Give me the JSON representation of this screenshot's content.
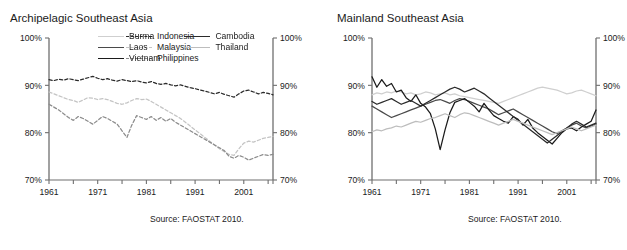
{
  "figure": {
    "cut_top_text": "",
    "source_note": "Source: FAOSTAT 2010."
  },
  "panels": [
    {
      "id": "archipelagic",
      "title": "Archipelagic Southeast Asia",
      "source": "Source: FAOSTAT 2010.",
      "legend_columns": [
        [
          {
            "name": "Indonesia",
            "color": "#2b2b2b",
            "style": "dashed"
          },
          {
            "name": "Malaysia",
            "color": "#c4c4c4",
            "style": "dashed"
          },
          {
            "name": "Philippines",
            "color": "#8c8c8c",
            "style": "dashed"
          }
        ]
      ]
    },
    {
      "id": "mainland",
      "title": "Mainland Southeast Asia",
      "source": "Source: FAOSTAT 2010.",
      "legend_columns": [
        [
          {
            "name": "Burma",
            "color": "#cfcfcf",
            "style": "solid"
          },
          {
            "name": "Laos",
            "color": "#4a4a4a",
            "style": "solid"
          },
          {
            "name": "Vietnam",
            "color": "#1b1b1b",
            "style": "solid"
          }
        ],
        [
          {
            "name": "Cambodia",
            "color": "#2b2b2b",
            "style": "solid"
          },
          {
            "name": "Thailand",
            "color": "#bdbdbd",
            "style": "solid"
          }
        ]
      ]
    }
  ],
  "chart_data": [
    {
      "type": "line",
      "title": "Archipelagic Southeast Asia",
      "xlabel": "",
      "ylabel": "",
      "xlim": [
        1961,
        2007
      ],
      "ylim": [
        70,
        100
      ],
      "yticks": [
        70,
        80,
        90,
        100
      ],
      "ytick_labels": [
        "70%",
        "80%",
        "90%",
        "100%"
      ],
      "xticks": [
        1961,
        1971,
        1981,
        1991,
        2001
      ],
      "xtick_labels": [
        "1961",
        "1971",
        "1981",
        "1991",
        "2001"
      ],
      "x": [
        1961,
        1962,
        1963,
        1964,
        1965,
        1966,
        1967,
        1968,
        1969,
        1970,
        1971,
        1972,
        1973,
        1974,
        1975,
        1976,
        1977,
        1978,
        1979,
        1980,
        1981,
        1982,
        1983,
        1984,
        1985,
        1986,
        1987,
        1988,
        1989,
        1990,
        1991,
        1992,
        1993,
        1994,
        1995,
        1996,
        1997,
        1998,
        1999,
        2000,
        2001,
        2002,
        2003,
        2004,
        2005,
        2006,
        2007
      ],
      "grid": false,
      "legend_position": "upper-center",
      "dual_y_axis": true,
      "series": [
        {
          "name": "Indonesia",
          "color": "#2b2b2b",
          "style": "dashed",
          "values": [
            91.2,
            91.0,
            91.3,
            91.1,
            91.4,
            91.2,
            91.0,
            91.3,
            91.6,
            91.9,
            91.5,
            91.2,
            91.4,
            91.1,
            90.9,
            91.2,
            91.0,
            90.8,
            91.0,
            90.7,
            90.5,
            90.8,
            90.4,
            90.2,
            90.4,
            90.1,
            89.9,
            90.1,
            89.8,
            89.5,
            89.3,
            89.0,
            88.8,
            88.5,
            88.2,
            88.5,
            88.1,
            87.8,
            87.5,
            88.2,
            88.8,
            89.0,
            88.6,
            88.2,
            88.5,
            88.3,
            88.0
          ]
        },
        {
          "name": "Malaysia",
          "color": "#c4c4c4",
          "style": "dashed",
          "values": [
            88.6,
            88.2,
            87.8,
            87.4,
            87.0,
            86.8,
            86.4,
            86.9,
            87.4,
            87.3,
            87.0,
            87.2,
            87.0,
            86.6,
            86.2,
            86.0,
            86.3,
            86.8,
            87.2,
            87.0,
            87.1,
            86.6,
            86.0,
            85.4,
            84.8,
            84.2,
            83.6,
            83.0,
            82.2,
            81.4,
            80.6,
            79.8,
            79.0,
            78.2,
            77.4,
            76.6,
            76.0,
            75.4,
            75.2,
            76.6,
            77.8,
            78.2,
            78.0,
            78.4,
            78.8,
            79.0,
            79.2
          ]
        },
        {
          "name": "Philippines",
          "color": "#8c8c8c",
          "style": "dashed",
          "values": [
            86.0,
            85.4,
            84.8,
            84.0,
            83.2,
            82.6,
            83.4,
            83.0,
            82.4,
            81.8,
            82.6,
            83.4,
            83.0,
            82.4,
            81.8,
            80.4,
            79.0,
            81.6,
            83.6,
            83.2,
            82.8,
            83.4,
            82.6,
            83.2,
            82.4,
            83.0,
            82.2,
            81.6,
            81.0,
            80.4,
            79.8,
            79.2,
            78.6,
            78.0,
            77.4,
            76.8,
            76.2,
            75.0,
            74.6,
            75.2,
            74.8,
            74.2,
            74.6,
            75.0,
            75.4,
            75.2,
            75.4
          ]
        }
      ]
    },
    {
      "type": "line",
      "title": "Mainland Southeast Asia",
      "xlabel": "",
      "ylabel": "",
      "xlim": [
        1961,
        2007
      ],
      "ylim": [
        70,
        100
      ],
      "yticks": [
        70,
        80,
        90,
        100
      ],
      "ytick_labels": [
        "70%",
        "80%",
        "90%",
        "100%"
      ],
      "xticks": [
        1961,
        1971,
        1981,
        1991,
        2001
      ],
      "xtick_labels": [
        "1961",
        "1971",
        "1981",
        "1991",
        "2001"
      ],
      "x": [
        1961,
        1962,
        1963,
        1964,
        1965,
        1966,
        1967,
        1968,
        1969,
        1970,
        1971,
        1972,
        1973,
        1974,
        1975,
        1976,
        1977,
        1978,
        1979,
        1980,
        1981,
        1982,
        1983,
        1984,
        1985,
        1986,
        1987,
        1988,
        1989,
        1990,
        1991,
        1992,
        1993,
        1994,
        1995,
        1996,
        1997,
        1998,
        1999,
        2000,
        2001,
        2002,
        2003,
        2004,
        2005,
        2006,
        2007
      ],
      "grid": false,
      "legend_position": "upper-center",
      "dual_y_axis": true,
      "series": [
        {
          "name": "Burma",
          "color": "#cfcfcf",
          "style": "solid",
          "values": [
            88.0,
            88.4,
            88.2,
            88.6,
            88.4,
            88.8,
            88.6,
            88.2,
            88.4,
            88.0,
            88.2,
            88.6,
            88.4,
            88.0,
            88.2,
            88.4,
            88.0,
            88.2,
            87.8,
            87.6,
            87.4,
            87.2,
            87.0,
            86.8,
            86.6,
            86.4,
            86.2,
            86.6,
            87.0,
            87.4,
            87.8,
            88.2,
            88.6,
            89.0,
            89.4,
            89.6,
            89.4,
            89.2,
            89.0,
            88.6,
            88.2,
            88.4,
            88.8,
            89.0,
            88.6,
            88.2,
            87.8
          ]
        },
        {
          "name": "Laos",
          "color": "#4a4a4a",
          "style": "solid",
          "values": [
            85.6,
            85.0,
            84.4,
            83.8,
            83.2,
            83.6,
            84.0,
            84.4,
            84.8,
            85.2,
            85.6,
            86.0,
            86.4,
            86.8,
            87.0,
            86.6,
            86.2,
            86.8,
            87.2,
            87.0,
            86.6,
            86.2,
            85.8,
            85.4,
            85.0,
            84.4,
            83.8,
            84.2,
            84.6,
            85.0,
            84.4,
            83.8,
            83.2,
            82.6,
            82.0,
            81.4,
            80.8,
            80.2,
            79.8,
            80.4,
            81.0,
            81.6,
            82.0,
            81.4,
            81.0,
            81.4,
            81.8
          ]
        },
        {
          "name": "Vietnam",
          "color": "#1b1b1b",
          "style": "solid",
          "values": [
            91.8,
            89.6,
            91.2,
            89.8,
            90.4,
            88.6,
            89.0,
            87.4,
            86.6,
            88.0,
            86.2,
            85.4,
            84.0,
            80.8,
            76.4,
            80.6,
            84.2,
            86.4,
            86.8,
            87.2,
            86.4,
            85.6,
            84.4,
            86.2,
            84.8,
            83.6,
            83.0,
            82.4,
            82.0,
            83.4,
            82.8,
            81.6,
            82.8,
            81.0,
            80.0,
            79.2,
            78.4,
            77.6,
            78.8,
            80.0,
            80.8,
            81.0,
            80.4,
            81.2,
            81.8,
            82.4,
            84.8
          ]
        },
        {
          "name": "Cambodia",
          "color": "#2b2b2b",
          "style": "solid",
          "values": [
            86.6,
            86.0,
            86.4,
            86.8,
            87.2,
            86.6,
            86.0,
            86.4,
            86.8,
            86.2,
            85.6,
            86.2,
            86.8,
            87.4,
            88.0,
            88.6,
            89.2,
            89.6,
            89.2,
            88.6,
            89.0,
            89.4,
            88.8,
            88.2,
            87.4,
            86.6,
            85.8,
            85.0,
            84.2,
            83.4,
            82.6,
            81.8,
            81.0,
            80.2,
            79.4,
            78.6,
            77.8,
            78.6,
            79.4,
            80.2,
            81.0,
            81.8,
            82.4,
            81.8,
            81.2,
            81.6,
            82.0
          ]
        },
        {
          "name": "Thailand",
          "color": "#bdbdbd",
          "style": "solid",
          "values": [
            80.2,
            80.6,
            80.4,
            80.8,
            81.0,
            81.4,
            81.2,
            81.6,
            82.0,
            82.4,
            82.2,
            82.6,
            83.0,
            83.2,
            83.6,
            84.0,
            83.6,
            83.2,
            83.8,
            84.2,
            84.0,
            83.6,
            83.2,
            82.8,
            82.4,
            82.0,
            81.6,
            82.0,
            82.4,
            82.8,
            82.4,
            82.0,
            81.6,
            81.2,
            80.8,
            80.4,
            80.0,
            79.6,
            80.0,
            80.4,
            80.8,
            81.2,
            80.8,
            80.4,
            80.8,
            81.2,
            81.6
          ]
        }
      ]
    }
  ]
}
